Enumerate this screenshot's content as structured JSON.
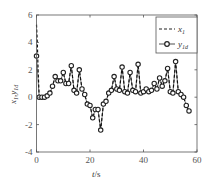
{
  "chart_data": {
    "type": "line",
    "title": "",
    "xlabel": "t/s",
    "ylabel": "x1,y1d",
    "xlim": [
      0,
      60
    ],
    "ylim": [
      -4,
      6
    ],
    "xticks": [
      0,
      20,
      40,
      60
    ],
    "yticks": [
      -4,
      -2,
      0,
      2,
      4,
      6
    ],
    "grid": false,
    "legend_position": "upper right",
    "series": [
      {
        "name": "x1",
        "style": "dashed",
        "x": [
          0,
          0.3,
          0.6,
          1,
          2,
          3,
          4,
          5,
          6,
          7,
          8,
          9,
          10,
          11,
          12,
          13,
          14,
          15,
          16,
          17,
          18,
          19,
          20,
          21,
          22,
          23,
          24,
          25,
          26,
          27,
          28,
          29,
          30,
          31,
          32,
          33,
          34,
          35,
          36,
          37,
          38,
          39,
          40,
          41,
          42,
          43,
          44,
          45,
          46,
          47,
          48,
          49,
          50,
          51,
          52,
          53,
          54,
          55,
          56,
          57
        ],
        "y": [
          5.3,
          4.0,
          2.0,
          0.0,
          0.0,
          0.0,
          0.1,
          0.3,
          0.8,
          1.5,
          1.2,
          1.2,
          1.8,
          1.0,
          1.0,
          2.3,
          0.5,
          0.3,
          2.0,
          0.6,
          0.2,
          -0.5,
          -0.6,
          -1.5,
          -0.9,
          -0.9,
          -2.4,
          -0.5,
          -0.3,
          0.3,
          0.5,
          1.5,
          0.6,
          0.5,
          2.2,
          0.4,
          0.3,
          1.8,
          0.5,
          0.4,
          2.4,
          0.3,
          0.4,
          0.6,
          0.4,
          0.5,
          1.0,
          0.6,
          1.4,
          0.8,
          1.2,
          2.1,
          0.4,
          0.3,
          2.6,
          0.4,
          0.2,
          0.0,
          -0.6,
          -1.0
        ]
      },
      {
        "name": "y1d",
        "style": "solid-circle-markers",
        "x": [
          0,
          1,
          2,
          3,
          4,
          5,
          6,
          7,
          8,
          9,
          10,
          11,
          12,
          13,
          14,
          15,
          16,
          17,
          18,
          19,
          20,
          21,
          22,
          23,
          24,
          25,
          26,
          27,
          28,
          29,
          30,
          31,
          32,
          33,
          34,
          35,
          36,
          37,
          38,
          39,
          40,
          41,
          42,
          43,
          44,
          45,
          46,
          47,
          48,
          49,
          50,
          51,
          52,
          53,
          54,
          55,
          56,
          57
        ],
        "y": [
          3.0,
          0.0,
          0.0,
          0.0,
          0.1,
          0.3,
          0.8,
          1.5,
          1.2,
          1.2,
          1.8,
          1.0,
          1.0,
          2.3,
          0.5,
          0.3,
          2.0,
          0.6,
          0.2,
          -0.5,
          -0.6,
          -1.5,
          -0.9,
          -0.9,
          -2.4,
          -0.5,
          -0.3,
          0.3,
          0.5,
          1.5,
          0.6,
          0.5,
          2.2,
          0.4,
          0.3,
          1.8,
          0.5,
          0.4,
          2.4,
          0.3,
          0.4,
          0.6,
          0.4,
          0.5,
          1.0,
          0.6,
          1.4,
          0.8,
          1.2,
          2.1,
          0.4,
          0.3,
          2.6,
          0.4,
          0.2,
          0.0,
          -0.6,
          -1.0
        ]
      }
    ]
  },
  "legend": {
    "items": [
      {
        "label": "x",
        "sub": "1"
      },
      {
        "label": "y",
        "sub": "1d"
      }
    ]
  },
  "axes": {
    "xlabel_italic": "t",
    "xlabel_unit": "/s",
    "ylabel_main": "x",
    "ylabel_sub1": "1",
    "ylabel_sep": ",",
    "ylabel_main2": "y",
    "ylabel_sub2": "1d"
  }
}
